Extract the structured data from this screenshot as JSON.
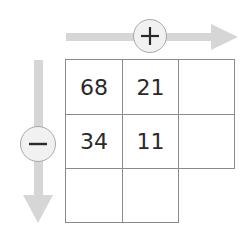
{
  "diagram": {
    "horizontal_arrow": {
      "symbol": "+",
      "direction": "right",
      "color": "#d3d3d3"
    },
    "vertical_arrow": {
      "symbol": "−",
      "direction": "down",
      "color": "#d3d3d3"
    },
    "grid": {
      "rows": [
        [
          "68",
          "21",
          ""
        ],
        [
          "34",
          "11",
          ""
        ],
        [
          "",
          ""
        ]
      ]
    }
  }
}
